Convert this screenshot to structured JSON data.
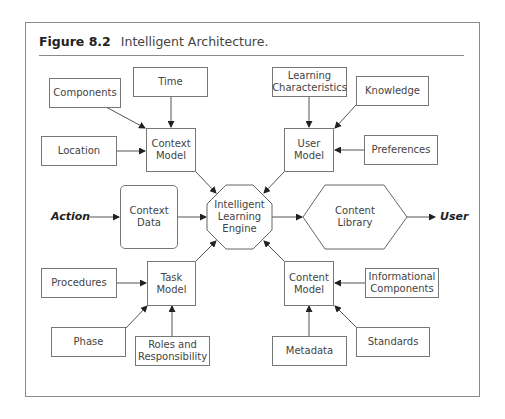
{
  "figure": {
    "number": "Figure 8.2",
    "title": "Intelligent Architecture."
  },
  "nodes": {
    "components": "Components",
    "time": "Time",
    "location": "Location",
    "context_model": "Context\nModel",
    "learning_characteristics": "Learning\nCharacteristics",
    "knowledge": "Knowledge",
    "user_model": "User\nModel",
    "preferences": "Preferences",
    "context_data": "Context\nData",
    "engine": "Intelligent\nLearning\nEngine",
    "content_library": "Content\nLibrary",
    "procedures": "Procedures",
    "task_model": "Task\nModel",
    "phase": "Phase",
    "roles": "Roles and\nResponsibility",
    "content_model": "Content\nModel",
    "informational_components": "Informational\nComponents",
    "metadata": "Metadata",
    "standards": "Standards"
  },
  "external": {
    "input": "Action",
    "output": "User"
  },
  "edges": [
    [
      "components",
      "context_model"
    ],
    [
      "time",
      "context_model"
    ],
    [
      "location",
      "context_model"
    ],
    [
      "learning_characteristics",
      "user_model"
    ],
    [
      "knowledge",
      "user_model"
    ],
    [
      "preferences",
      "user_model"
    ],
    [
      "action",
      "context_data"
    ],
    [
      "context_data",
      "engine"
    ],
    [
      "context_model",
      "engine"
    ],
    [
      "user_model",
      "engine"
    ],
    [
      "task_model",
      "engine"
    ],
    [
      "content_model",
      "engine"
    ],
    [
      "engine",
      "content_library"
    ],
    [
      "content_library",
      "user"
    ],
    [
      "procedures",
      "task_model"
    ],
    [
      "phase",
      "task_model"
    ],
    [
      "roles",
      "task_model"
    ],
    [
      "informational_components",
      "content_model"
    ],
    [
      "metadata",
      "content_model"
    ],
    [
      "standards",
      "content_model"
    ]
  ]
}
